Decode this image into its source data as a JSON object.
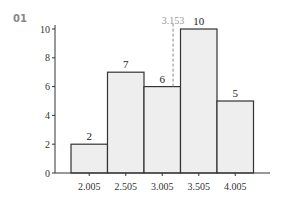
{
  "figure": {
    "number": "01"
  },
  "chart_data": {
    "type": "bar",
    "title": "",
    "xlabel": "",
    "ylabel": "",
    "categories": [
      "2.005",
      "2.505",
      "3.005",
      "3.505",
      "4.005"
    ],
    "values": [
      2,
      7,
      6,
      10,
      5
    ],
    "ylim": [
      0,
      10
    ],
    "yticks": [
      0,
      2,
      4,
      6,
      8,
      10
    ],
    "grid": false,
    "bar_color": "#eeeeee",
    "bar_edge_color": "#333333",
    "annotations": [
      {
        "type": "dashed-vline",
        "x": 3.153,
        "label": "3.153",
        "color": "#888888"
      }
    ]
  }
}
